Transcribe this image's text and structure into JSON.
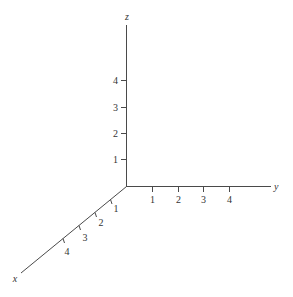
{
  "diagram": {
    "type": "3d-coordinate-axes",
    "colors": {
      "axis": "#4a4a4a",
      "text": "#333333",
      "background": "#ffffff"
    },
    "axes": {
      "z": {
        "label": "z",
        "ticks": [
          "1",
          "2",
          "3",
          "4"
        ]
      },
      "y": {
        "label": "y",
        "ticks": [
          "1",
          "2",
          "3",
          "4"
        ]
      },
      "x": {
        "label": "x",
        "ticks": [
          "1",
          "2",
          "3",
          "4"
        ]
      }
    }
  }
}
